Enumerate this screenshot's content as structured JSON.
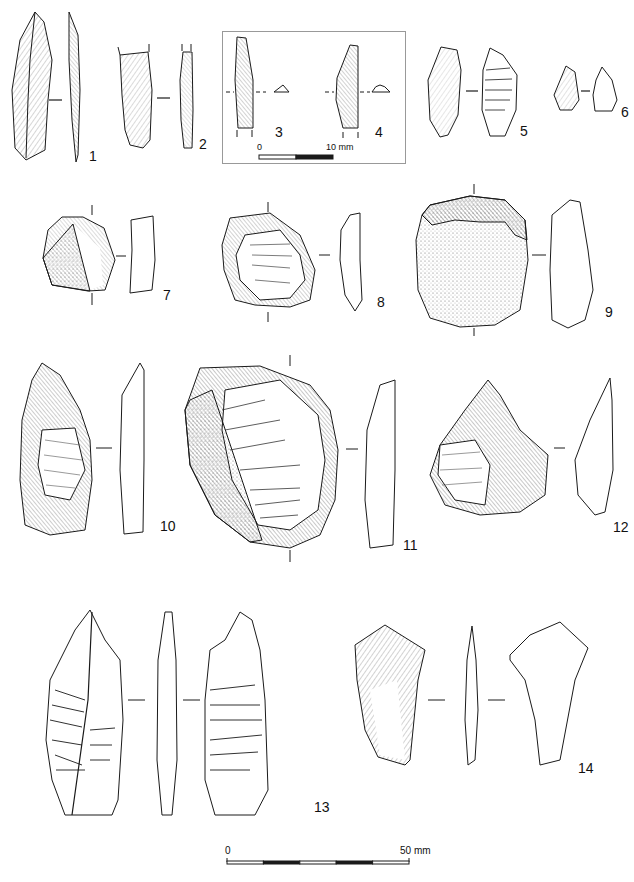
{
  "plate": {
    "title": "Lithic artefacts plate",
    "artefacts": [
      {
        "number": "1",
        "label": "1"
      },
      {
        "number": "2",
        "label": "2"
      },
      {
        "number": "3",
        "label": "3"
      },
      {
        "number": "4",
        "label": "4"
      },
      {
        "number": "5",
        "label": "5"
      },
      {
        "number": "6",
        "label": "6"
      },
      {
        "number": "7",
        "label": "7"
      },
      {
        "number": "8",
        "label": "8"
      },
      {
        "number": "9",
        "label": "9"
      },
      {
        "number": "10",
        "label": "10"
      },
      {
        "number": "11",
        "label": "11"
      },
      {
        "number": "12",
        "label": "12"
      },
      {
        "number": "13",
        "label": "13"
      },
      {
        "number": "14",
        "label": "14"
      }
    ],
    "inset_scale": {
      "start": "0",
      "end": "10 mm",
      "segments": 2
    },
    "main_scale": {
      "start": "0",
      "end": "50 mm",
      "segments": 5
    }
  },
  "colors": {
    "ink": "#1a1a1a",
    "cortex": "#9a9a9a",
    "frame": "#999999",
    "background": "#ffffff"
  }
}
